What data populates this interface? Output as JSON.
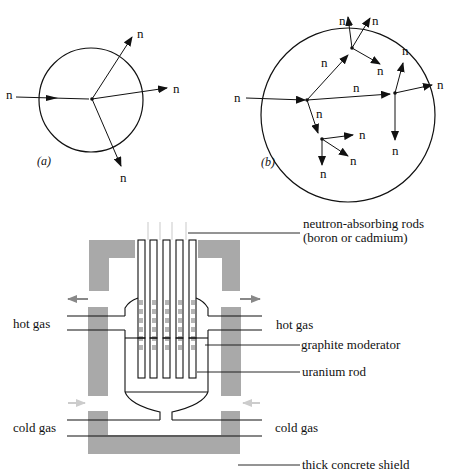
{
  "figure_a": {
    "caption": "(a)",
    "incoming_label": "n",
    "outgoing_labels": [
      "n",
      "n",
      "n"
    ]
  },
  "figure_b": {
    "caption": "(b)",
    "incoming_label": "n",
    "branch_labels": [
      "n",
      "n",
      "n",
      "n",
      "n",
      "n",
      "n",
      "n",
      "n",
      "n",
      "n",
      "n"
    ]
  },
  "reactor": {
    "labels": {
      "rods": "neutron-absorbing rods",
      "rods_sub": "(boron or cadmium)",
      "hot_gas_left": "hot gas",
      "hot_gas_right": "hot gas",
      "moderator": "graphite moderator",
      "uranium": "uranium rod",
      "cold_gas_left": "cold gas",
      "cold_gas_right": "cold gas",
      "shield": "thick concrete shield"
    },
    "colors": {
      "shield": "#a9a9a9",
      "line": "#111111",
      "moderator_block": "#b5b5b5"
    }
  }
}
